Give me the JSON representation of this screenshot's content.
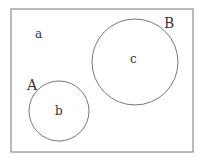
{
  "diagram": {
    "type": "venn",
    "universe": {
      "x": 11,
      "y": 9,
      "w": 182,
      "h": 143,
      "label_region": "a"
    },
    "sets": [
      {
        "name": "A",
        "cx": 59,
        "cy": 111,
        "r": 30,
        "region_label": "b",
        "name_pos": [
          32,
          89
        ],
        "region_pos": [
          58,
          115
        ]
      },
      {
        "name": "B",
        "cx": 135,
        "cy": 62,
        "r": 43,
        "region_label": "c",
        "name_pos": [
          169,
          28
        ],
        "region_pos": [
          134,
          63
        ]
      }
    ],
    "outside_label": {
      "text": "a",
      "pos": [
        38,
        38
      ]
    },
    "colors": {
      "stroke": "#777777",
      "text": "#333333",
      "background": "#ffffff"
    }
  }
}
